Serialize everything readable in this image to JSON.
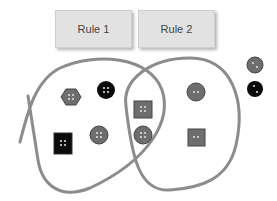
{
  "rules": [
    {
      "label": "Rule 1"
    },
    {
      "label": "Rule 2"
    }
  ],
  "colors": {
    "loop": "#8c8c8c",
    "gray_button": "#6e6e6e",
    "black_button": "#0a0a0a",
    "rule_box": "#e2e2e2"
  },
  "buttons": [
    {
      "shape": "hexagon",
      "color": "gray",
      "holes": 4,
      "region": "rule1-only"
    },
    {
      "shape": "circle",
      "color": "black",
      "holes": 4,
      "region": "rule1-only"
    },
    {
      "shape": "square",
      "color": "black",
      "holes": 4,
      "region": "rule1-only"
    },
    {
      "shape": "circle",
      "color": "gray",
      "holes": 4,
      "region": "rule1-only"
    },
    {
      "shape": "square",
      "color": "gray",
      "holes": 4,
      "region": "both"
    },
    {
      "shape": "circle",
      "color": "gray",
      "holes": 4,
      "region": "both"
    },
    {
      "shape": "circle",
      "color": "gray",
      "holes": 2,
      "region": "rule2-only"
    },
    {
      "shape": "square",
      "color": "gray",
      "holes": 2,
      "region": "rule2-only"
    },
    {
      "shape": "circle",
      "color": "gray",
      "holes": 2,
      "region": "outside"
    },
    {
      "shape": "circle",
      "color": "black",
      "holes": 2,
      "region": "outside"
    }
  ]
}
